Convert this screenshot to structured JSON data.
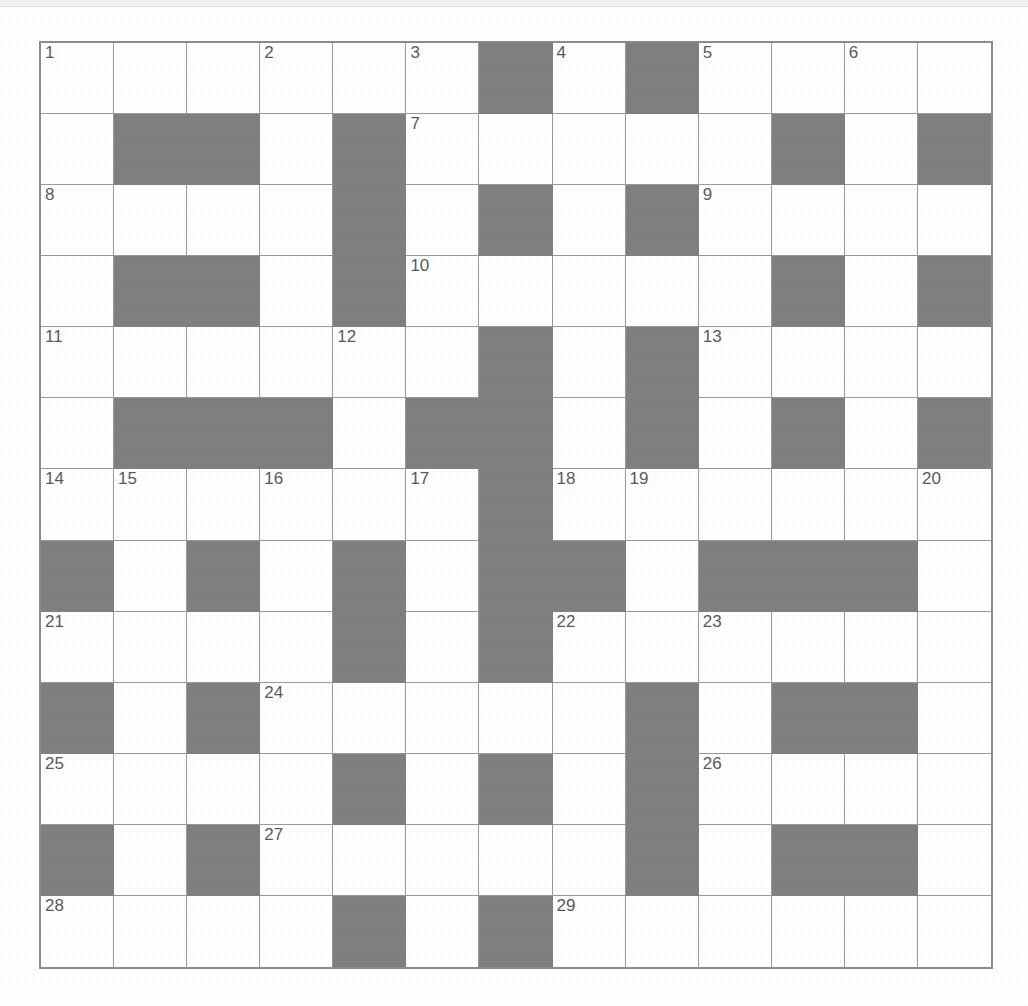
{
  "puzzle": {
    "type": "crossword-grid",
    "title": "Crossword puzzle grid",
    "rows": 13,
    "columns": 13,
    "colors": {
      "block": "#808080",
      "cell": "#ffffff",
      "grid_line": "#9a9a9a",
      "border": "#8c8c8c",
      "clue_number_text": "#5a5a5a",
      "page_background": "#ffffff"
    },
    "legend": {
      "block_label": "blocked square",
      "open_label": "open square"
    },
    "clue_numbers_present": [
      1,
      2,
      3,
      4,
      5,
      6,
      7,
      8,
      9,
      10,
      11,
      12,
      13,
      14,
      15,
      16,
      17,
      18,
      19,
      20,
      21,
      22,
      23,
      24,
      25,
      26,
      27,
      28,
      29
    ],
    "grid": [
      {
        "row": 1,
        "cells": [
          {
            "block": false,
            "num": "1"
          },
          {
            "block": false,
            "num": ""
          },
          {
            "block": false,
            "num": ""
          },
          {
            "block": false,
            "num": "2"
          },
          {
            "block": false,
            "num": ""
          },
          {
            "block": false,
            "num": "3"
          },
          {
            "block": true,
            "num": ""
          },
          {
            "block": false,
            "num": "4"
          },
          {
            "block": true,
            "num": ""
          },
          {
            "block": false,
            "num": "5"
          },
          {
            "block": false,
            "num": ""
          },
          {
            "block": false,
            "num": "6"
          },
          {
            "block": false,
            "num": ""
          }
        ]
      },
      {
        "row": 2,
        "cells": [
          {
            "block": false,
            "num": ""
          },
          {
            "block": true,
            "num": ""
          },
          {
            "block": true,
            "num": ""
          },
          {
            "block": false,
            "num": ""
          },
          {
            "block": true,
            "num": ""
          },
          {
            "block": false,
            "num": "7"
          },
          {
            "block": false,
            "num": ""
          },
          {
            "block": false,
            "num": ""
          },
          {
            "block": false,
            "num": ""
          },
          {
            "block": false,
            "num": ""
          },
          {
            "block": true,
            "num": ""
          },
          {
            "block": false,
            "num": ""
          },
          {
            "block": true,
            "num": ""
          }
        ]
      },
      {
        "row": 3,
        "cells": [
          {
            "block": false,
            "num": "8"
          },
          {
            "block": false,
            "num": ""
          },
          {
            "block": false,
            "num": ""
          },
          {
            "block": false,
            "num": ""
          },
          {
            "block": true,
            "num": ""
          },
          {
            "block": false,
            "num": ""
          },
          {
            "block": true,
            "num": ""
          },
          {
            "block": false,
            "num": ""
          },
          {
            "block": true,
            "num": ""
          },
          {
            "block": false,
            "num": "9"
          },
          {
            "block": false,
            "num": ""
          },
          {
            "block": false,
            "num": ""
          },
          {
            "block": false,
            "num": ""
          }
        ]
      },
      {
        "row": 4,
        "cells": [
          {
            "block": false,
            "num": ""
          },
          {
            "block": true,
            "num": ""
          },
          {
            "block": true,
            "num": ""
          },
          {
            "block": false,
            "num": ""
          },
          {
            "block": true,
            "num": ""
          },
          {
            "block": false,
            "num": "10"
          },
          {
            "block": false,
            "num": ""
          },
          {
            "block": false,
            "num": ""
          },
          {
            "block": false,
            "num": ""
          },
          {
            "block": false,
            "num": ""
          },
          {
            "block": true,
            "num": ""
          },
          {
            "block": false,
            "num": ""
          },
          {
            "block": true,
            "num": ""
          }
        ]
      },
      {
        "row": 5,
        "cells": [
          {
            "block": false,
            "num": "11"
          },
          {
            "block": false,
            "num": ""
          },
          {
            "block": false,
            "num": ""
          },
          {
            "block": false,
            "num": ""
          },
          {
            "block": false,
            "num": "12"
          },
          {
            "block": false,
            "num": ""
          },
          {
            "block": true,
            "num": ""
          },
          {
            "block": false,
            "num": ""
          },
          {
            "block": true,
            "num": ""
          },
          {
            "block": false,
            "num": "13"
          },
          {
            "block": false,
            "num": ""
          },
          {
            "block": false,
            "num": ""
          },
          {
            "block": false,
            "num": ""
          }
        ]
      },
      {
        "row": 6,
        "cells": [
          {
            "block": false,
            "num": ""
          },
          {
            "block": true,
            "num": ""
          },
          {
            "block": true,
            "num": ""
          },
          {
            "block": true,
            "num": ""
          },
          {
            "block": false,
            "num": ""
          },
          {
            "block": true,
            "num": ""
          },
          {
            "block": true,
            "num": ""
          },
          {
            "block": false,
            "num": ""
          },
          {
            "block": true,
            "num": ""
          },
          {
            "block": false,
            "num": ""
          },
          {
            "block": true,
            "num": ""
          },
          {
            "block": false,
            "num": ""
          },
          {
            "block": true,
            "num": ""
          }
        ]
      },
      {
        "row": 7,
        "cells": [
          {
            "block": false,
            "num": "14"
          },
          {
            "block": false,
            "num": "15"
          },
          {
            "block": false,
            "num": ""
          },
          {
            "block": false,
            "num": "16"
          },
          {
            "block": false,
            "num": ""
          },
          {
            "block": false,
            "num": "17"
          },
          {
            "block": true,
            "num": ""
          },
          {
            "block": false,
            "num": "18"
          },
          {
            "block": false,
            "num": "19"
          },
          {
            "block": false,
            "num": ""
          },
          {
            "block": false,
            "num": ""
          },
          {
            "block": false,
            "num": ""
          },
          {
            "block": false,
            "num": "20"
          }
        ]
      },
      {
        "row": 8,
        "cells": [
          {
            "block": true,
            "num": ""
          },
          {
            "block": false,
            "num": ""
          },
          {
            "block": true,
            "num": ""
          },
          {
            "block": false,
            "num": ""
          },
          {
            "block": true,
            "num": ""
          },
          {
            "block": false,
            "num": ""
          },
          {
            "block": true,
            "num": ""
          },
          {
            "block": true,
            "num": ""
          },
          {
            "block": false,
            "num": ""
          },
          {
            "block": true,
            "num": ""
          },
          {
            "block": true,
            "num": ""
          },
          {
            "block": true,
            "num": ""
          },
          {
            "block": false,
            "num": ""
          }
        ]
      },
      {
        "row": 9,
        "cells": [
          {
            "block": false,
            "num": "21"
          },
          {
            "block": false,
            "num": ""
          },
          {
            "block": false,
            "num": ""
          },
          {
            "block": false,
            "num": ""
          },
          {
            "block": true,
            "num": ""
          },
          {
            "block": false,
            "num": ""
          },
          {
            "block": true,
            "num": ""
          },
          {
            "block": false,
            "num": "22"
          },
          {
            "block": false,
            "num": ""
          },
          {
            "block": false,
            "num": "23"
          },
          {
            "block": false,
            "num": ""
          },
          {
            "block": false,
            "num": ""
          },
          {
            "block": false,
            "num": ""
          }
        ]
      },
      {
        "row": 10,
        "cells": [
          {
            "block": true,
            "num": ""
          },
          {
            "block": false,
            "num": ""
          },
          {
            "block": true,
            "num": ""
          },
          {
            "block": false,
            "num": "24"
          },
          {
            "block": false,
            "num": ""
          },
          {
            "block": false,
            "num": ""
          },
          {
            "block": false,
            "num": ""
          },
          {
            "block": false,
            "num": ""
          },
          {
            "block": true,
            "num": ""
          },
          {
            "block": false,
            "num": ""
          },
          {
            "block": true,
            "num": ""
          },
          {
            "block": true,
            "num": ""
          },
          {
            "block": false,
            "num": ""
          }
        ]
      },
      {
        "row": 11,
        "cells": [
          {
            "block": false,
            "num": "25"
          },
          {
            "block": false,
            "num": ""
          },
          {
            "block": false,
            "num": ""
          },
          {
            "block": false,
            "num": ""
          },
          {
            "block": true,
            "num": ""
          },
          {
            "block": false,
            "num": ""
          },
          {
            "block": true,
            "num": ""
          },
          {
            "block": false,
            "num": ""
          },
          {
            "block": true,
            "num": ""
          },
          {
            "block": false,
            "num": "26"
          },
          {
            "block": false,
            "num": ""
          },
          {
            "block": false,
            "num": ""
          },
          {
            "block": false,
            "num": ""
          }
        ]
      },
      {
        "row": 12,
        "cells": [
          {
            "block": true,
            "num": ""
          },
          {
            "block": false,
            "num": ""
          },
          {
            "block": true,
            "num": ""
          },
          {
            "block": false,
            "num": "27"
          },
          {
            "block": false,
            "num": ""
          },
          {
            "block": false,
            "num": ""
          },
          {
            "block": false,
            "num": ""
          },
          {
            "block": false,
            "num": ""
          },
          {
            "block": true,
            "num": ""
          },
          {
            "block": false,
            "num": ""
          },
          {
            "block": true,
            "num": ""
          },
          {
            "block": true,
            "num": ""
          },
          {
            "block": false,
            "num": ""
          }
        ]
      },
      {
        "row": 13,
        "cells": [
          {
            "block": false,
            "num": "28"
          },
          {
            "block": false,
            "num": ""
          },
          {
            "block": false,
            "num": ""
          },
          {
            "block": false,
            "num": ""
          },
          {
            "block": true,
            "num": ""
          },
          {
            "block": false,
            "num": ""
          },
          {
            "block": true,
            "num": ""
          },
          {
            "block": false,
            "num": "29"
          },
          {
            "block": false,
            "num": ""
          },
          {
            "block": false,
            "num": ""
          },
          {
            "block": false,
            "num": ""
          },
          {
            "block": false,
            "num": ""
          },
          {
            "block": false,
            "num": ""
          }
        ]
      }
    ]
  }
}
